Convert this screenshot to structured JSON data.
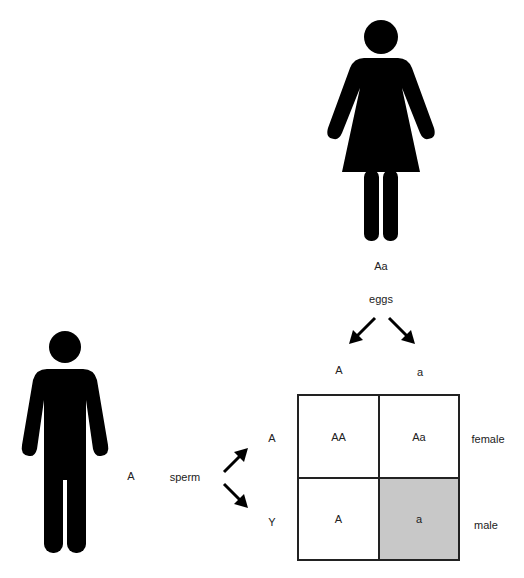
{
  "mother": {
    "genotype": "Aa",
    "gamete_label": "eggs",
    "gametes": [
      "A",
      "a"
    ]
  },
  "father": {
    "genotype": "A",
    "gamete_label": "sperm",
    "gametes": [
      "A",
      "Y"
    ]
  },
  "punnett": {
    "columns": [
      "A",
      "a"
    ],
    "rows": [
      {
        "header": "A",
        "cells": [
          "AA",
          "Aa"
        ],
        "sex": "female"
      },
      {
        "header": "Y",
        "cells": [
          "A",
          "a"
        ],
        "sex": "male"
      }
    ],
    "highlight_cell": {
      "row": 1,
      "col": 1,
      "color": "#c8c8c8"
    }
  },
  "colors": {
    "figure": "#000000",
    "grid_line": "#222222",
    "shaded": "#c8c8c8",
    "background": "#ffffff"
  }
}
